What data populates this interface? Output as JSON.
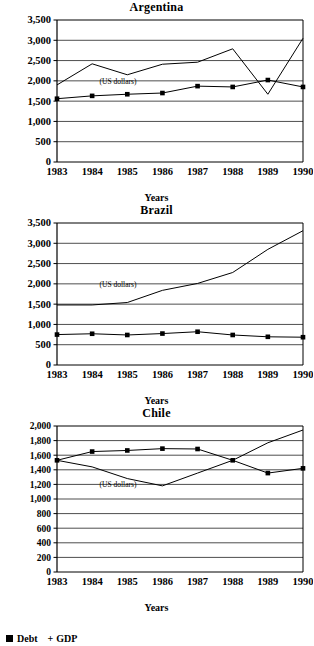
{
  "legend": {
    "debt_label": "Debt",
    "plus_sign": "+",
    "gdp_label": "GDP"
  },
  "axis_label": "Years",
  "annotation": "(US dollars)",
  "panels": [
    {
      "title": "Argentina",
      "ylabel_ticks": [
        "0",
        "500",
        "1,000",
        "1,500",
        "2,000",
        "2,500",
        "3,000",
        "3,500"
      ],
      "xlabel_ticks": [
        "1983",
        "1984",
        "1985",
        "1986",
        "1987",
        "1988",
        "1989",
        "1990"
      ],
      "axis_title": "Years"
    },
    {
      "title": "Brazil",
      "ylabel_ticks": [
        "0",
        "500",
        "1,000",
        "1,500",
        "2,000",
        "2,500",
        "3,000",
        "3,500"
      ],
      "xlabel_ticks": [
        "1983",
        "1984",
        "1985",
        "1986",
        "1987",
        "1988",
        "1989",
        "1990"
      ],
      "axis_title": "Years"
    },
    {
      "title": "Chile",
      "ylabel_ticks": [
        "0",
        "200",
        "400",
        "600",
        "800",
        "1,000",
        "1,200",
        "1,400",
        "1,600",
        "1,800",
        "2,000"
      ],
      "xlabel_ticks": [
        "1983",
        "1984",
        "1985",
        "1986",
        "1987",
        "1988",
        "1989",
        "1990"
      ],
      "axis_title": "Years"
    }
  ],
  "chart_data": [
    {
      "type": "line",
      "title": "Argentina",
      "xlabel": "Years",
      "ylabel": "",
      "annotation": "(US dollars)",
      "categories": [
        "1983",
        "1984",
        "1985",
        "1986",
        "1987",
        "1988",
        "1989",
        "1990"
      ],
      "ylim": [
        0,
        3500
      ],
      "ytick_step": 500,
      "grid": true,
      "legend_position": "bottom-left",
      "series": [
        {
          "name": "Debt",
          "marker": "square",
          "values": [
            1560,
            1630,
            1670,
            1700,
            1870,
            1850,
            2020,
            1850
          ]
        },
        {
          "name": "GDP",
          "marker": "none",
          "values": [
            1900,
            2420,
            2150,
            2410,
            2460,
            2790,
            1670,
            3050
          ]
        }
      ]
    },
    {
      "type": "line",
      "title": "Brazil",
      "xlabel": "Years",
      "ylabel": "",
      "annotation": "(US dollars)",
      "categories": [
        "1983",
        "1984",
        "1985",
        "1986",
        "1987",
        "1988",
        "1989",
        "1990"
      ],
      "ylim": [
        0,
        3500
      ],
      "ytick_step": 500,
      "grid": true,
      "legend_position": "bottom-left",
      "series": [
        {
          "name": "Debt",
          "marker": "square",
          "values": [
            750,
            770,
            740,
            775,
            820,
            740,
            695,
            685
          ]
        },
        {
          "name": "GDP",
          "marker": "none",
          "values": [
            1480,
            1480,
            1540,
            1840,
            2010,
            2280,
            2850,
            3310
          ]
        }
      ]
    },
    {
      "type": "line",
      "title": "Chile",
      "xlabel": "Years",
      "ylabel": "",
      "annotation": "(US dollars)",
      "categories": [
        "1983",
        "1984",
        "1985",
        "1986",
        "1987",
        "1988",
        "1989",
        "1990"
      ],
      "ylim": [
        0,
        2000
      ],
      "ytick_step": 200,
      "grid": true,
      "legend_position": "bottom-left",
      "series": [
        {
          "name": "Debt",
          "marker": "square",
          "values": [
            1530,
            1650,
            1665,
            1690,
            1685,
            1530,
            1355,
            1420
          ]
        },
        {
          "name": "GDP",
          "marker": "none",
          "values": [
            1530,
            1440,
            1280,
            1180,
            1355,
            1530,
            1770,
            1945
          ]
        }
      ]
    }
  ]
}
